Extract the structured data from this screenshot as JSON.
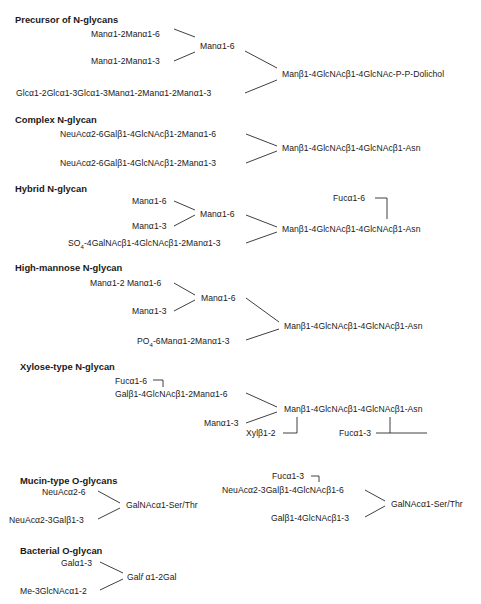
{
  "sections": {
    "precursor": {
      "title": "Precursor of N-glycans",
      "a": "Manα1-2Manα1-6",
      "b": "Manα1-2Manα1-3",
      "c": "Manα1-6",
      "d": "Glcα1-2Glcα1-3Glcα1-3Manα1-2Manα1-2Manα1-3",
      "core": "Manβ1-4GlcNAcβ1-4GlcNAc-P-P-Dolichol"
    },
    "complex": {
      "title": "Complex N-glycan",
      "a": "NeuAcα2-6Galβ1-4GlcNAcβ1-2Manα1-6",
      "b": "NeuAcα2-6Galβ1-4GlcNAcβ1-2Manα1-3",
      "core": "Manβ1-4GlcNAcβ1-4GlcNAcβ1-Asn"
    },
    "hybrid": {
      "title": "Hybrid N-glycan",
      "a": "Manα1-6",
      "b": "Manα1-3",
      "c": "Manα1-6",
      "d": "SO4-4GalNAcβ1-4GlcNAcβ1-2Manα1-3",
      "d_prefix": "SO",
      "d_sub": "4",
      "d_rest": "-4GalNAcβ1-4GlcNAcβ1-2Manα1-3",
      "fuc": "Fucα1-6",
      "core": "Manβ1-4GlcNAcβ1-4GlcNAcβ1-Asn"
    },
    "highmannose": {
      "title": "High-mannose N-glycan",
      "a": "Manα1-2 Manα1-6",
      "b": "Manα1-3",
      "c": "Manα1-6",
      "d_prefix": "PO",
      "d_sub": "4",
      "d_rest": "-6Manα1-2Manα1-3",
      "core": "Manβ1-4GlcNAcβ1-4GlcNAcβ1-Asn"
    },
    "xylose": {
      "title": "Xylose-type N-glycan",
      "fuc6": "Fucα1-6",
      "a": "Galβ1-4GlcNAcβ1-2Manα1-6",
      "b": "Manα1-3",
      "xyl": "Xylβ1-2",
      "fuc3": "Fucα1-3",
      "core": "Manβ1-4GlcNAcβ1-4GlcNAcβ1-Asn"
    },
    "mucin": {
      "title": "Mucin-type O-glycans",
      "left": {
        "a": "NeuAcα2-6",
        "b": "NeuAcα2-3Galβ1-3",
        "core": "GalNAcα1-Ser/Thr"
      },
      "right": {
        "fuc": "Fucα1-3",
        "a": "NeuAcα2-3Galβ1-4GlcNAcβ1-6",
        "b": "Galβ1-4GlcNAcβ1-3",
        "core": "GalNAcα1-Ser/Thr"
      }
    },
    "bacterial": {
      "title": "Bacterial O-glycan",
      "a": "Galα1-3",
      "b": "Me-3GlcNAcα1-2",
      "core_prefix": "Gal",
      "core_italic": "f",
      "core_rest": " α1-2Gal"
    }
  }
}
